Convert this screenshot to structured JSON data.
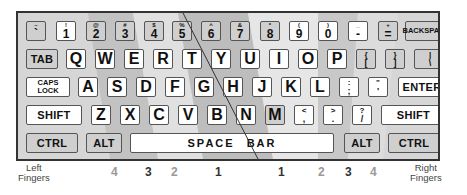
{
  "keyboard": {
    "row1": [
      {
        "top": "~",
        "bottom": "`"
      },
      {
        "top": "!",
        "bottom": "1"
      },
      {
        "top": "@",
        "bottom": "2"
      },
      {
        "top": "#",
        "bottom": "3"
      },
      {
        "top": "$",
        "bottom": "4"
      },
      {
        "top": "%",
        "bottom": "5"
      },
      {
        "top": "^",
        "bottom": "6"
      },
      {
        "top": "&",
        "bottom": "7"
      },
      {
        "top": "*",
        "bottom": "8"
      },
      {
        "top": "(",
        "bottom": "9"
      },
      {
        "top": ")",
        "bottom": "0"
      },
      {
        "top": "_",
        "bottom": "-"
      },
      {
        "top": "+",
        "bottom": "="
      },
      {
        "label": "BACKSPACE"
      }
    ],
    "row2": {
      "tab": "TAB",
      "letters": [
        "Q",
        "W",
        "E",
        "R",
        "T",
        "Y",
        "U",
        "I",
        "O",
        "P"
      ],
      "punct": [
        {
          "top": "{",
          "bottom": "["
        },
        {
          "top": "}",
          "bottom": "]"
        },
        {
          "top": "|",
          "bottom": "\\"
        }
      ]
    },
    "row3": {
      "caps_line1": "CAPS",
      "caps_line2": "LOCK",
      "letters": [
        "A",
        "S",
        "D",
        "F",
        "G",
        "H",
        "J",
        "K",
        "L"
      ],
      "punct": [
        {
          "top": ":",
          "bottom": ";"
        },
        {
          "top": "\"",
          "bottom": "'"
        }
      ],
      "enter": "ENTER"
    },
    "row4": {
      "shift_left": "SHIFT",
      "letters": [
        "Z",
        "X",
        "C",
        "V",
        "B",
        "N",
        "M"
      ],
      "punct": [
        {
          "top": "<",
          "bottom": ","
        },
        {
          "top": ">",
          "bottom": "."
        },
        {
          "top": "?",
          "bottom": "/"
        }
      ],
      "shift_right": "SHIFT"
    },
    "row5": {
      "ctrl_left": "CTRL",
      "alt_left": "ALT",
      "space_left": "SPACE",
      "space_right": "BAR",
      "alt_right": "ALT",
      "ctrl_right": "CTRL"
    }
  },
  "fingers": {
    "left_label_1": "Left",
    "left_label_2": "Fingers",
    "right_label_1": "Right",
    "right_label_2": "Fingers",
    "left": [
      "4",
      "3",
      "2",
      "1"
    ],
    "right": [
      "1",
      "2",
      "3",
      "4"
    ]
  }
}
